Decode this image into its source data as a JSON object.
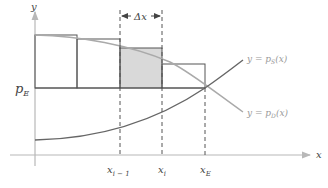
{
  "diagram": {
    "axes": {
      "x_label": "x",
      "y_label": "y"
    },
    "price_label": {
      "base": "p",
      "sub": "E"
    },
    "delta_label": "Δx",
    "tick_labels": [
      {
        "base": "x",
        "sub": "i − 1"
      },
      {
        "base": "x",
        "sub": "i"
      },
      {
        "base": "x",
        "sub": "E"
      }
    ],
    "curves": {
      "supply": {
        "prefix": "y = p",
        "sub": "S",
        "suffix": "(x)"
      },
      "demand": {
        "prefix": "y = p",
        "sub": "D",
        "suffix": "(x)"
      }
    },
    "colors": {
      "axis": "#b8b8b8",
      "rect_stroke": "#555555",
      "shaded_fill": "#d9d9d9",
      "supply_curve": "#666666",
      "demand_curve": "#aaaaaa",
      "text": "#444444"
    }
  }
}
